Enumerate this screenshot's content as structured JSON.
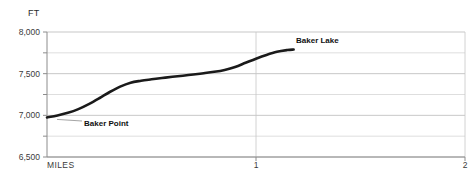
{
  "chart_data": {
    "type": "line",
    "title": "",
    "xlabel": "MILES",
    "ylabel": "FT",
    "xlim": [
      0,
      2
    ],
    "ylim": [
      6500,
      8000
    ],
    "grid": true,
    "legend": "none",
    "y_ticks": [
      {
        "value": 8000,
        "label": "8,000",
        "major": true
      },
      {
        "value": 7750,
        "label": "",
        "major": false
      },
      {
        "value": 7500,
        "label": "7,500",
        "major": true
      },
      {
        "value": 7250,
        "label": "",
        "major": false
      },
      {
        "value": 7000,
        "label": "7,000",
        "major": true
      },
      {
        "value": 6750,
        "label": "",
        "major": false
      },
      {
        "value": 6500,
        "label": "6,500",
        "major": true
      }
    ],
    "x_ticks": [
      {
        "value": 0,
        "label": ""
      },
      {
        "value": 1,
        "label": "1"
      },
      {
        "value": 2,
        "label": "2"
      }
    ],
    "series": [
      {
        "name": "elevation-profile",
        "color": "#1a1a1a",
        "points": [
          {
            "x": 0.0,
            "y": 6975
          },
          {
            "x": 0.05,
            "y": 6998
          },
          {
            "x": 0.1,
            "y": 7030
          },
          {
            "x": 0.15,
            "y": 7075
          },
          {
            "x": 0.2,
            "y": 7135
          },
          {
            "x": 0.25,
            "y": 7205
          },
          {
            "x": 0.3,
            "y": 7280
          },
          {
            "x": 0.35,
            "y": 7345
          },
          {
            "x": 0.4,
            "y": 7392
          },
          {
            "x": 0.45,
            "y": 7415
          },
          {
            "x": 0.5,
            "y": 7432
          },
          {
            "x": 0.55,
            "y": 7448
          },
          {
            "x": 0.6,
            "y": 7462
          },
          {
            "x": 0.65,
            "y": 7476
          },
          {
            "x": 0.7,
            "y": 7490
          },
          {
            "x": 0.75,
            "y": 7505
          },
          {
            "x": 0.8,
            "y": 7522
          },
          {
            "x": 0.85,
            "y": 7545
          },
          {
            "x": 0.9,
            "y": 7580
          },
          {
            "x": 0.95,
            "y": 7630
          },
          {
            "x": 1.0,
            "y": 7680
          },
          {
            "x": 1.05,
            "y": 7725
          },
          {
            "x": 1.1,
            "y": 7762
          },
          {
            "x": 1.15,
            "y": 7783
          },
          {
            "x": 1.18,
            "y": 7790
          }
        ]
      }
    ],
    "annotations": [
      {
        "name": "baker-lake",
        "label": "Baker Lake",
        "x": 1.18,
        "y": 7790,
        "placement": "right"
      },
      {
        "name": "baker-point",
        "label": "Baker Point",
        "x": 0.0,
        "y": 6975,
        "placement": "below-right"
      }
    ]
  }
}
